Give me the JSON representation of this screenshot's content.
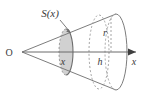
{
  "figure": {
    "type": "geometry-diagram",
    "canvas": {
      "width": 146,
      "height": 99,
      "background": "#ffffff"
    },
    "colors": {
      "stroke": "#7d7d7d",
      "stroke_dark": "#4a4a4a",
      "shaded_fill": "#c9c9c9",
      "shaded_stroke": "#6e6e6e",
      "dashed_stroke": "#9a9a9a",
      "text": "#3a3a3a",
      "axis": "#6a6a6a"
    },
    "labels": {
      "area_function": "S(x)",
      "origin": "O",
      "radius": "r",
      "height": "h",
      "axis_name": "x",
      "distance": "x"
    },
    "label_positions": {
      "area_function": {
        "x": 50,
        "y": 16
      },
      "origin": {
        "x": 8,
        "y": 56
      },
      "radius": {
        "x": 104,
        "y": 35
      },
      "height": {
        "x": 99,
        "y": 64
      },
      "axis_name": {
        "x": 134,
        "y": 64
      },
      "distance": {
        "x": 62,
        "y": 64
      }
    },
    "geometry": {
      "vertex": {
        "x": 22,
        "y": 52
      },
      "axis_line": {
        "x1": 22,
        "y1": 52,
        "x2": 140,
        "y2": 52
      },
      "base_center": {
        "x": 116,
        "y": 52
      },
      "base_radius_x": 11,
      "base_radius_y": 38,
      "back_ellipse_center": {
        "x": 98,
        "y": 52
      },
      "back_ellipse_radius_x": 10,
      "back_ellipse_radius_y": 36,
      "cross_section_center": {
        "x": 66,
        "y": 52
      },
      "cross_section_radius_x": 7,
      "cross_section_radius_y": 23,
      "upper_slant": {
        "x1": 22,
        "y1": 52,
        "x2": 116,
        "y2": 14
      },
      "lower_slant": {
        "x1": 22,
        "y1": 52,
        "x2": 116,
        "y2": 90
      },
      "leader_line": {
        "x1": 60,
        "y1": 21,
        "x2": 69,
        "y2": 31
      }
    }
  }
}
